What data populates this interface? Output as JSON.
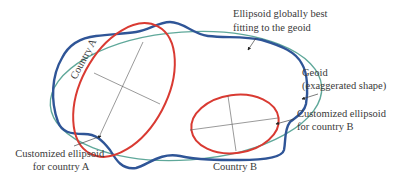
{
  "diagram": {
    "labels": {
      "global_ellipsoid": [
        "Ellipsoid globally best",
        "fitting to the geoid"
      ],
      "geoid": [
        "Geoid",
        "(exaggerated shape)"
      ],
      "custom_b": [
        "Customized ellipsoid",
        "for country B"
      ],
      "custom_a": [
        "Customized ellipsoid",
        "for country A"
      ],
      "country_a": "Country A",
      "country_b": "Country B"
    },
    "colors": {
      "global_ellipsoid": "#5fa89a",
      "geoid": "#2f5597",
      "custom_ellipsoid": "#d93a32",
      "axis": "#555555",
      "text": "#3a3a3a"
    }
  }
}
